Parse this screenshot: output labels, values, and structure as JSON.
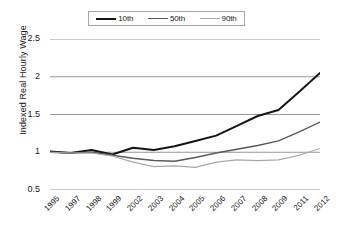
{
  "chart_data": {
    "type": "line",
    "title": "",
    "xlabel": "",
    "ylabel": "Indexed Real Hourly Wage",
    "ylim": [
      0.5,
      2.5
    ],
    "yticks": [
      "0.5",
      "1",
      "1.5",
      "2",
      "2.5"
    ],
    "ytick_values": [
      0.5,
      1,
      1.5,
      2,
      2.5
    ],
    "grid": true,
    "legend_position": "top",
    "categories": [
      "1995",
      "1997",
      "1998",
      "1999",
      "2002",
      "2003",
      "2004",
      "2005",
      "2006",
      "2007",
      "2008",
      "2009",
      "2011",
      "2012"
    ],
    "series": [
      {
        "name": "10th",
        "color": "#141414",
        "width": 2.0,
        "values": [
          1.01,
          0.99,
          1.03,
          0.97,
          1.06,
          1.03,
          1.08,
          1.15,
          1.22,
          1.35,
          1.48,
          1.56,
          1.8,
          2.05
        ]
      },
      {
        "name": "50th",
        "color": "#5a5a5a",
        "width": 1.4,
        "values": [
          1.0,
          0.99,
          1.0,
          0.96,
          0.92,
          0.89,
          0.88,
          0.93,
          0.99,
          1.04,
          1.09,
          1.15,
          1.27,
          1.4
        ]
      },
      {
        "name": "90th",
        "color": "#a8a8a8",
        "width": 1.2,
        "values": [
          1.0,
          0.99,
          0.99,
          0.95,
          0.87,
          0.81,
          0.82,
          0.8,
          0.87,
          0.9,
          0.89,
          0.9,
          0.96,
          1.05
        ]
      }
    ]
  },
  "legend": {
    "items": [
      {
        "label": "10th"
      },
      {
        "label": "50th"
      },
      {
        "label": "90th"
      }
    ]
  }
}
